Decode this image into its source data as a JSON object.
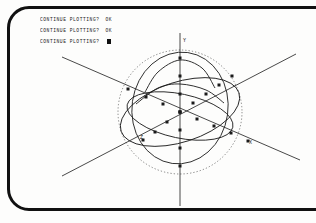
{
  "terminal": {
    "prompts": [
      {
        "text": "CONTINUE PLOTTING?",
        "answer": "OK",
        "cursor": false
      },
      {
        "text": "CONTINUE PLOTTING?",
        "answer": "OK",
        "cursor": false
      },
      {
        "text": "CONTINUE PLOTTING?",
        "answer": "",
        "cursor": true
      }
    ]
  },
  "plot": {
    "axis_labels": {
      "x": "X",
      "y": "Y",
      "z": "Z"
    },
    "colors": {
      "ink": "#1a1a1a",
      "frame": "#111111",
      "paper": "#fdfdfc",
      "dotted": "#555555"
    }
  },
  "chart_data": {
    "type": "scatter",
    "title": "",
    "xlabel": "X",
    "ylabel": "Y",
    "zlabel": "Z",
    "grid": false,
    "legend": null,
    "projection": "3d-oblique",
    "origin_px": [
      180,
      112
    ],
    "axes": [
      {
        "name": "Y",
        "from_px": [
          180,
          206
        ],
        "to_px": [
          180,
          33
        ],
        "label_px": [
          183,
          42
        ]
      },
      {
        "name": "X",
        "from_px": [
          62,
          57
        ],
        "to_px": [
          300,
          160
        ],
        "label_px": [
          249,
          144
        ]
      },
      {
        "name": "Z",
        "from_px": [
          296,
          54
        ],
        "to_px": [
          62,
          176
        ],
        "label_px": [
          140,
          139
        ]
      }
    ],
    "marker": "square",
    "marker_size_px": 3,
    "series": [
      {
        "name": "y-axis-points",
        "points_px": [
          [
            180,
            58
          ],
          [
            180,
            76
          ],
          [
            180,
            94
          ],
          [
            180,
            112
          ],
          [
            180,
            130
          ],
          [
            180,
            148
          ],
          [
            180,
            166
          ]
        ]
      },
      {
        "name": "x-axis-points",
        "points_px": [
          [
            128,
            89
          ],
          [
            146,
            97
          ],
          [
            163,
            104
          ],
          [
            180,
            112
          ],
          [
            197,
            119
          ],
          [
            214,
            126
          ],
          [
            231,
            133
          ],
          [
            248,
            141
          ]
        ]
      },
      {
        "name": "z-axis-points",
        "points_px": [
          [
            143,
            140
          ],
          [
            155,
            132
          ],
          [
            167,
            122
          ],
          [
            180,
            112
          ],
          [
            193,
            103
          ],
          [
            206,
            94
          ],
          [
            219,
            85
          ],
          [
            232,
            76
          ]
        ]
      },
      {
        "name": "curve-upper-arc",
        "points_px": [
          [
            145,
            92
          ],
          [
            158,
            72
          ],
          [
            180,
            60
          ],
          [
            202,
            68
          ],
          [
            215,
            88
          ]
        ]
      },
      {
        "name": "curve-equator",
        "points_px": [
          [
            136,
            104
          ],
          [
            158,
            88
          ],
          [
            180,
            84
          ],
          [
            206,
            90
          ],
          [
            224,
            103
          ]
        ]
      }
    ],
    "shapes": [
      {
        "kind": "circle-dotted",
        "center_px": [
          180,
          112
        ],
        "radius_px": 62,
        "note": "sphere silhouette"
      },
      {
        "kind": "ellipse-solid",
        "center_px": [
          180,
          112
        ],
        "rx_px": 62,
        "ry_px": 30,
        "rotate_deg": -18
      },
      {
        "kind": "ellipse-solid",
        "center_px": [
          180,
          108
        ],
        "rx_px": 48,
        "ry_px": 56,
        "rotate_deg": 8
      },
      {
        "kind": "ellipse-solid",
        "center_px": [
          180,
          116
        ],
        "rx_px": 54,
        "ry_px": 22,
        "rotate_deg": 12
      }
    ]
  }
}
